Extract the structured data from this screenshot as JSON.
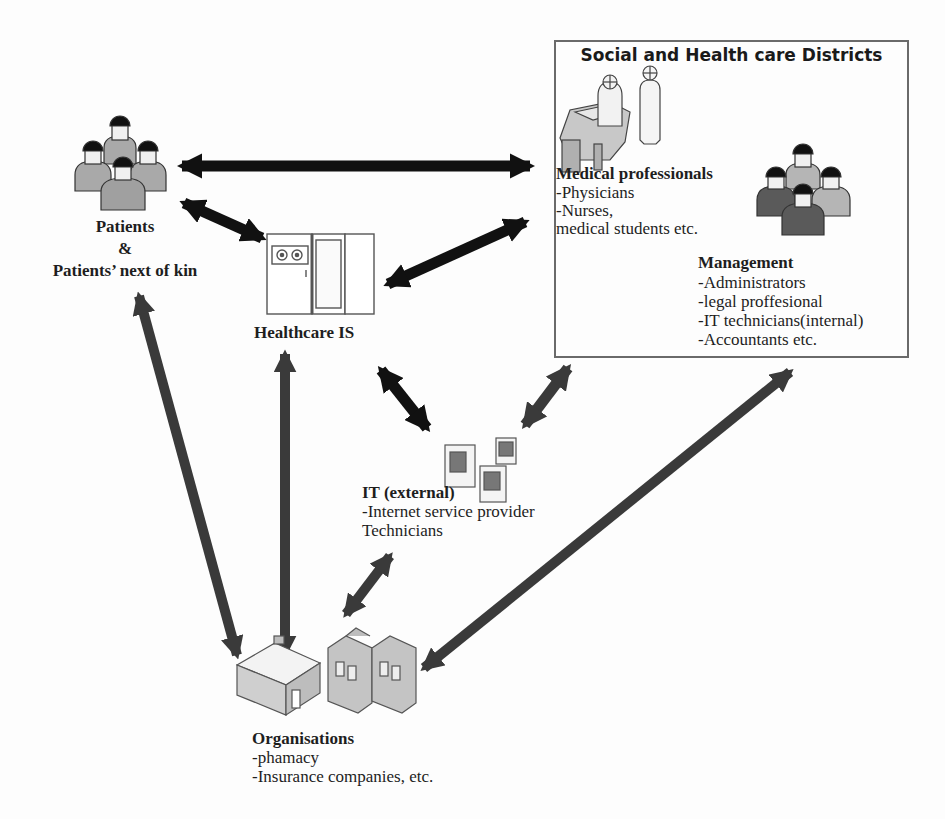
{
  "diagram": {
    "type": "stakeholder-relationship-diagram",
    "colors": {
      "arrow_black": "#111111",
      "arrow_dark_grey": "#3a3a3a",
      "box_border": "#6a6a6a",
      "patient_figure_fill": "#a9a9a9",
      "management_dark_fill": "#5a5a5a",
      "management_light_fill": "#b5b5b5",
      "hair": "#111111",
      "face": "#f0f0f0",
      "equipment_outline": "#555555"
    }
  },
  "nodes": {
    "patients": {
      "label_line1": "Patients",
      "label_line2": "&",
      "label_line3": "Patients’ next of kin",
      "icon": "group-of-people-icon"
    },
    "healthcare_is": {
      "label": "Healthcare IS",
      "icon": "mainframe-server-icon"
    },
    "districts": {
      "title": "Social and Health care Districts",
      "medical_professionals": {
        "heading": "Medical professionals",
        "items": [
          "-Physicians",
          "-Nurses,",
          " medical students etc."
        ],
        "icon": "doctor-at-desk-icon"
      },
      "management": {
        "heading": "Management",
        "items": [
          "-Administrators",
          "-legal proffesional",
          "-IT technicians(internal)",
          "-Accountants etc."
        ],
        "icon": "group-of-people-icon"
      }
    },
    "it_external": {
      "heading": "IT (external)",
      "items": [
        "-Internet service provider",
        "Technicians"
      ],
      "icon": "server-towers-icon"
    },
    "organisations": {
      "heading": "Organisations",
      "items": [
        "-phamacy",
        "-Insurance companies, etc."
      ],
      "icon": "houses-icon"
    }
  },
  "edges": [
    {
      "from": "patients",
      "to": "districts",
      "style": "black",
      "bidirectional": true
    },
    {
      "from": "patients",
      "to": "healthcare_is",
      "style": "black",
      "bidirectional": true
    },
    {
      "from": "healthcare_is",
      "to": "districts",
      "style": "black",
      "bidirectional": true
    },
    {
      "from": "healthcare_is",
      "to": "it_external",
      "style": "black",
      "bidirectional": true
    },
    {
      "from": "districts",
      "to": "it_external",
      "style": "dark-grey",
      "bidirectional": true
    },
    {
      "from": "patients",
      "to": "organisations",
      "style": "dark-grey",
      "bidirectional": true
    },
    {
      "from": "healthcare_is",
      "to": "organisations",
      "style": "dark-grey",
      "bidirectional": true
    },
    {
      "from": "it_external",
      "to": "organisations",
      "style": "dark-grey",
      "bidirectional": true
    },
    {
      "from": "districts",
      "to": "organisations",
      "style": "dark-grey",
      "bidirectional": true
    }
  ]
}
